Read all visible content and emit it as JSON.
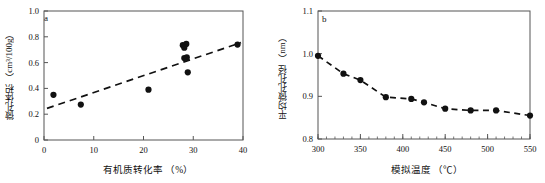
{
  "figure": {
    "panels": [
      {
        "id": "a",
        "label": "a",
        "annotation": "R² = 0.73"
      },
      {
        "id": "b",
        "label": "b",
        "annotation": ""
      }
    ]
  },
  "chart_data": [
    {
      "type": "scatter",
      "panel": "a",
      "title": "",
      "xlabel": "有机质转化率 （%）",
      "ylabel": "微孔体积 （cm³/100g）",
      "xlim": [
        0,
        40
      ],
      "ylim": [
        0,
        1.0
      ],
      "xticks": [
        0,
        10,
        20,
        30,
        40
      ],
      "xtick_labels": [
        "0",
        "10",
        "20",
        "30",
        "40"
      ],
      "yticks": [
        0,
        0.2,
        0.4,
        0.6,
        0.8,
        1.0
      ],
      "ytick_labels": [
        "0",
        "0.2",
        "0.4",
        "0.6",
        "0.8",
        "1.0"
      ],
      "grid": false,
      "legend": "none",
      "annotations": [
        {
          "text": "R² = 0.73",
          "x": 31.5,
          "y": 0.36
        }
      ],
      "points": [
        {
          "x": 1.9,
          "y": 0.35
        },
        {
          "x": 7.4,
          "y": 0.275
        },
        {
          "x": 21.0,
          "y": 0.39
        },
        {
          "x": 27.9,
          "y": 0.735
        },
        {
          "x": 28.2,
          "y": 0.715
        },
        {
          "x": 28.6,
          "y": 0.745
        },
        {
          "x": 28.2,
          "y": 0.635
        },
        {
          "x": 28.7,
          "y": 0.64
        },
        {
          "x": 28.9,
          "y": 0.525
        },
        {
          "x": 38.9,
          "y": 0.74
        }
      ],
      "trendline": {
        "style": "dashed",
        "x": [
          0.6,
          39.6
        ],
        "y": [
          0.245,
          0.755
        ],
        "r_squared": 0.73
      }
    },
    {
      "type": "line",
      "panel": "b",
      "title": "",
      "xlabel": "模拟温度 （℃）",
      "ylabel": "平均微孔孔径 （nm）",
      "xlim": [
        300,
        550
      ],
      "ylim": [
        0.8,
        1.1
      ],
      "xticks": [
        300,
        350,
        400,
        450,
        500,
        550
      ],
      "xtick_labels": [
        "300",
        "350",
        "400",
        "450",
        "500",
        "550"
      ],
      "yticks": [
        0.8,
        0.9,
        1.0,
        1.1
      ],
      "ytick_labels": [
        "0.8",
        "0.9",
        "1.0",
        "1.1"
      ],
      "minor_xticks": true,
      "grid": false,
      "legend": "none",
      "marker": "filled-circle",
      "line_style": "dashed",
      "x": [
        300,
        330,
        350,
        380,
        410,
        425,
        450,
        480,
        510,
        550
      ],
      "y": [
        0.995,
        0.953,
        0.938,
        0.898,
        0.894,
        0.886,
        0.871,
        0.867,
        0.867,
        0.855
      ]
    }
  ]
}
